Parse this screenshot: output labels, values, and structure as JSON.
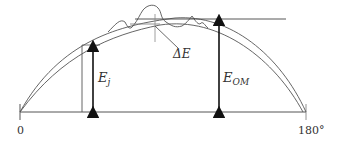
{
  "diagram": {
    "type": "energy profile / arc diagram",
    "axis": {
      "start_label": "0",
      "end_label": "180°"
    },
    "labels": {
      "ej_main": "E",
      "ej_sub": "j",
      "eom_main": "E",
      "eom_sub": "OM",
      "delta_e": "ΔE"
    },
    "colors": {
      "line": "#444444",
      "arrow": "#111111",
      "text": "#333333",
      "background": "#ffffff"
    }
  }
}
